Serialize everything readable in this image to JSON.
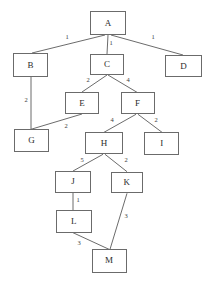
{
  "diagram": {
    "style": {
      "background": "#ffffff",
      "node_border": "#6b6b6b",
      "node_fill": "#ffffff",
      "edge_color": "#5a5a5a",
      "label_color": "#3d3d3d"
    },
    "nodes": [
      {
        "id": "A",
        "label": "A",
        "x": 90,
        "y": 11,
        "w": 36,
        "h": 24
      },
      {
        "id": "B",
        "label": "B",
        "x": 13,
        "y": 53,
        "w": 35,
        "h": 24
      },
      {
        "id": "C",
        "label": "C",
        "x": 90,
        "y": 54,
        "w": 34,
        "h": 21
      },
      {
        "id": "D",
        "label": "D",
        "x": 165,
        "y": 55,
        "w": 37,
        "h": 22
      },
      {
        "id": "E",
        "label": "E",
        "x": 65,
        "y": 92,
        "w": 34,
        "h": 22
      },
      {
        "id": "F",
        "label": "F",
        "x": 120.7,
        "y": 92.3,
        "w": 34,
        "h": 22
      },
      {
        "id": "G",
        "label": "G",
        "x": 14,
        "y": 129.3,
        "w": 35,
        "h": 23
      },
      {
        "id": "H",
        "label": "H",
        "x": 85,
        "y": 132.3,
        "w": 38,
        "h": 22
      },
      {
        "id": "I",
        "label": "I",
        "x": 144.3,
        "y": 132.3,
        "w": 35,
        "h": 22.7
      },
      {
        "id": "J",
        "label": "J",
        "x": 55,
        "y": 171,
        "w": 36,
        "h": 21.7
      },
      {
        "id": "K",
        "label": "K",
        "x": 111,
        "y": 171.7,
        "w": 31.7,
        "h": 21.6
      },
      {
        "id": "L",
        "label": "L",
        "x": 56,
        "y": 210,
        "w": 35.7,
        "h": 22.7
      },
      {
        "id": "M",
        "label": "M",
        "x": 91.7,
        "y": 249.3,
        "w": 35,
        "h": 23.4
      }
    ],
    "edges": [
      {
        "from": "A",
        "to": "B",
        "weight": "1",
        "x1": 105,
        "y1": 35,
        "x2": 32,
        "y2": 53,
        "lx": 67,
        "ly": 37
      },
      {
        "from": "A",
        "to": "C",
        "weight": "1",
        "x1": 108,
        "y1": 35,
        "x2": 107,
        "y2": 54,
        "lx": 111,
        "ly": 43
      },
      {
        "from": "A",
        "to": "D",
        "weight": "1",
        "x1": 111,
        "y1": 35,
        "x2": 183,
        "y2": 55,
        "lx": 153,
        "ly": 37
      },
      {
        "from": "C",
        "to": "E",
        "weight": "2",
        "x1": 107,
        "y1": 75,
        "x2": 82,
        "y2": 92,
        "lx": 88,
        "ly": 80
      },
      {
        "from": "C",
        "to": "F",
        "weight": "4",
        "x1": 108,
        "y1": 75,
        "x2": 137,
        "y2": 92.3,
        "lx": 128,
        "ly": 80
      },
      {
        "from": "B",
        "to": "G",
        "weight": "2",
        "x1": 31,
        "y1": 77,
        "x2": 31,
        "y2": 129.3,
        "lx": 26,
        "ly": 100
      },
      {
        "from": "E",
        "to": "G",
        "weight": "2",
        "x1": 82,
        "y1": 114,
        "x2": 31,
        "y2": 129.3,
        "lx": 66,
        "ly": 126
      },
      {
        "from": "F",
        "to": "H",
        "weight": "4",
        "x1": 136,
        "y1": 114.3,
        "x2": 104,
        "y2": 132.3,
        "lx": 112,
        "ly": 120
      },
      {
        "from": "F",
        "to": "I",
        "weight": "2",
        "x1": 138,
        "y1": 114.3,
        "x2": 162,
        "y2": 132.3,
        "lx": 156,
        "ly": 120
      },
      {
        "from": "H",
        "to": "J",
        "weight": "5",
        "x1": 103,
        "y1": 154.3,
        "x2": 73,
        "y2": 171,
        "lx": 82,
        "ly": 160
      },
      {
        "from": "H",
        "to": "K",
        "weight": "2",
        "x1": 105,
        "y1": 154.3,
        "x2": 127,
        "y2": 171.7,
        "lx": 126,
        "ly": 160
      },
      {
        "from": "J",
        "to": "L",
        "weight": "1",
        "x1": 73,
        "y1": 192.7,
        "x2": 73,
        "y2": 210,
        "lx": 78,
        "ly": 200
      },
      {
        "from": "L",
        "to": "M",
        "weight": "3",
        "x1": 73,
        "y1": 232.7,
        "x2": 109,
        "y2": 249.3,
        "lx": 79,
        "ly": 243
      },
      {
        "from": "K",
        "to": "M",
        "weight": "3",
        "x1": 127,
        "y1": 193.3,
        "x2": 110,
        "y2": 249.3,
        "lx": 126,
        "ly": 216
      }
    ]
  }
}
